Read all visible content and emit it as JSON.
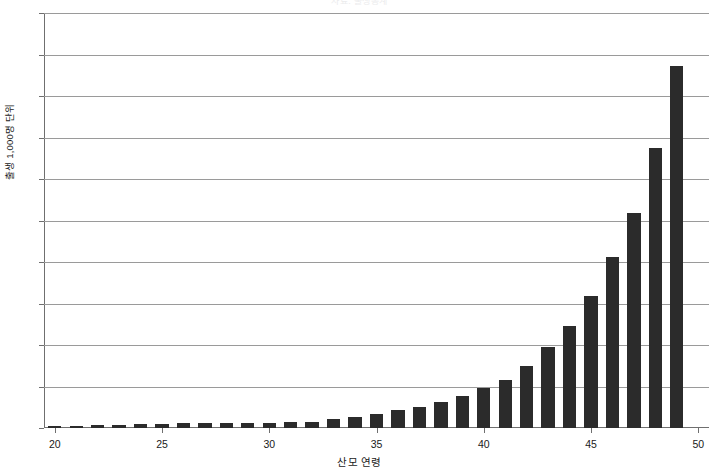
{
  "chart_data": {
    "type": "bar",
    "title": "자료: 출생통계",
    "xlabel": "산모 연령",
    "ylabel": "출생 1,000명 단위",
    "xlim": [
      19.5,
      50.5
    ],
    "ylim": [
      0,
      100
    ],
    "grid": true,
    "legend_position": "none",
    "bar_color": "#2b2b2b",
    "y_tick_labels": [
      "0",
      "10",
      "20",
      "30",
      "40",
      "50",
      "60",
      "70",
      "80",
      "90",
      "100"
    ],
    "y_ticks": [
      0,
      10,
      20,
      30,
      40,
      50,
      60,
      70,
      80,
      90,
      100
    ],
    "x_tick_labels": [
      "20",
      "25",
      "30",
      "35",
      "40",
      "45",
      "50"
    ],
    "x_ticks": [
      20,
      25,
      30,
      35,
      40,
      45,
      50
    ],
    "categories": [
      20,
      21,
      22,
      23,
      24,
      25,
      26,
      27,
      28,
      29,
      30,
      31,
      32,
      33,
      34,
      35,
      36,
      37,
      38,
      39,
      40,
      41,
      42,
      43,
      44,
      45,
      46,
      47,
      48,
      49,
      50
    ],
    "values": [
      0.6,
      0.6,
      0.7,
      0.7,
      0.9,
      1.0,
      1.1,
      1.1,
      1.2,
      1.2,
      1.3,
      1.4,
      1.5,
      2.2,
      2.7,
      3.3,
      4.3,
      5.1,
      6.3,
      7.6,
      9.6,
      11.6,
      15.0,
      19.6,
      24.7,
      31.7,
      41.3,
      51.9,
      67.4,
      87.3,
      0
    ]
  }
}
